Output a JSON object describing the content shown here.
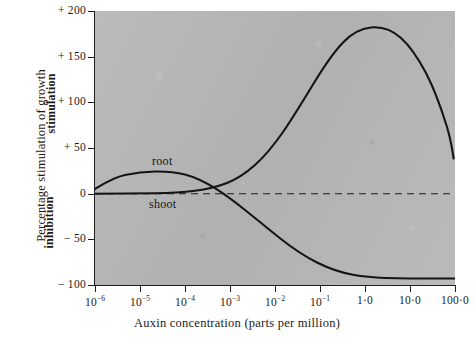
{
  "figure": {
    "top_clipped_text_left": "",
    "top_clipped_text_right": "",
    "plot_background_color": "#b7b7b7",
    "curve_color": "#141414",
    "axis_color": "#1f1f1f"
  },
  "axes": {
    "y_title_outer": "Percentage stimulation of growth",
    "y_title_upper": "stimulation",
    "y_title_lower": "inhibition",
    "x_title": "Auxin concentration (parts per million)",
    "y_ticklabels": [
      "+ 200",
      "+ 150",
      "+ 100",
      "+ 50",
      "0",
      "− 50",
      "− 100"
    ],
    "y_tickvalues": [
      200,
      150,
      100,
      50,
      0,
      -50,
      -100
    ],
    "x_ticklabels": [
      "10−6",
      "10−5",
      "10−4",
      "10−3",
      "10−2",
      "10−1",
      "1·0",
      "10·0",
      "100·0"
    ],
    "x_tick_mantissas": [
      "10",
      "10",
      "10",
      "10",
      "10",
      "10",
      "1·0",
      "10·0",
      "100·0"
    ],
    "x_tick_exponents": [
      "-6",
      "-5",
      "-4",
      "-3",
      "-2",
      "-1",
      "",
      "",
      ""
    ]
  },
  "annotations": {
    "root_label": "root",
    "shoot_label": "shoot",
    "zero_line": "0"
  },
  "chart_data": {
    "type": "line",
    "title": "",
    "subtitle": "",
    "xlabel": "Auxin concentration (parts per million)",
    "ylabel": "Percentage stimulation of growth",
    "xscale": "log",
    "xlim": [
      1e-06,
      100
    ],
    "ylim": [
      -100,
      200
    ],
    "ytick_values": [
      -100,
      -50,
      0,
      50,
      100,
      150,
      200
    ],
    "xtick_values": [
      1e-06,
      1e-05,
      0.0001,
      0.001,
      0.01,
      0.1,
      1,
      10,
      100
    ],
    "grid": false,
    "legend": "inline-annotations",
    "reference_lines": [
      {
        "type": "horizontal",
        "value": 0,
        "style": "dashed",
        "label": "zero growth response"
      }
    ],
    "series": [
      {
        "name": "root",
        "label_position": {
          "x": 0.0001,
          "y": 40
        },
        "x": [
          1e-06,
          3e-06,
          1e-05,
          3e-05,
          0.0001,
          0.0003,
          0.001,
          0.003,
          0.01,
          0.03,
          0.1,
          0.3,
          1,
          3,
          10,
          30,
          100
        ],
        "y": [
          5,
          11,
          17,
          20,
          21,
          19,
          13,
          4,
          -8,
          -22,
          -38,
          -55,
          -72,
          -87,
          -97,
          -100,
          -100
        ]
      },
      {
        "name": "shoot",
        "label_position": {
          "x": 0.0001,
          "y": -18
        },
        "x": [
          1e-06,
          3e-06,
          1e-05,
          3e-05,
          0.0001,
          0.0003,
          0.001,
          0.003,
          0.01,
          0.03,
          0.1,
          0.3,
          1,
          2,
          3,
          10,
          30,
          100
        ],
        "y": [
          0,
          0,
          0,
          0,
          1,
          2,
          4,
          9,
          20,
          42,
          75,
          118,
          167,
          185,
          184,
          150,
          105,
          30
        ]
      }
    ]
  }
}
